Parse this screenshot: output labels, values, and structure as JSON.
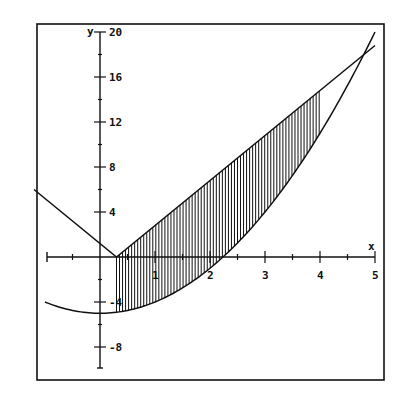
{
  "chart_data": {
    "type": "line",
    "title": "",
    "xlabel": "x",
    "ylabel": "y",
    "xlim": [
      -1.2,
      5
    ],
    "ylim": [
      -10,
      20
    ],
    "grid": false,
    "legend": null,
    "x_ticks": [
      1,
      2,
      3,
      4,
      5
    ],
    "x_minor_ticks": [
      -0.5,
      0.5,
      1.5,
      2.5,
      3.5,
      4.5
    ],
    "y_ticks": [
      -8,
      -4,
      4,
      8,
      12,
      16,
      20
    ],
    "y_tick_labels": [
      "-8",
      "-4",
      "4",
      "8",
      "12",
      "16",
      "20"
    ],
    "series": [
      {
        "name": "V-shaped line y = |4x - 1.2|",
        "x": [
          -1.2,
          0.3,
          5.0
        ],
        "y": [
          6.0,
          0.0,
          18.8
        ]
      },
      {
        "name": "parabola y = x^2 - 5",
        "x": [
          -1.0,
          -0.5,
          0.0,
          0.5,
          1.0,
          1.5,
          2.0,
          2.5,
          3.0,
          3.5,
          4.0,
          4.5,
          5.0
        ],
        "y": [
          -4.0,
          -4.75,
          -5.0,
          -4.75,
          -4.0,
          -2.75,
          -1.0,
          1.25,
          4.0,
          7.25,
          11.0,
          15.25,
          20.0
        ]
      }
    ],
    "shaded_region": {
      "description": "vertical hatching between V-line (top) and parabola (bottom)",
      "x_from": 0.3,
      "x_to": 4.0
    }
  },
  "labels": {
    "x_axis": "x",
    "y_axis": "y"
  },
  "colors": {
    "ink": "#111111",
    "background": "#ffffff"
  }
}
